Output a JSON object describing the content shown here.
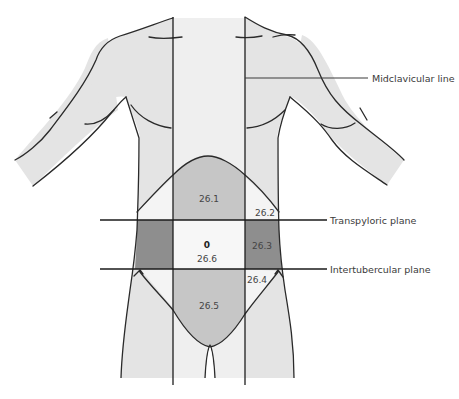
{
  "figure": {
    "colors": {
      "skin": "#e4e4e4",
      "midline_band": "#efefef",
      "region_medium": "#c6c6c6",
      "region_dark": "#8e8e8e",
      "region_light": "#f4f4f4",
      "outline": "#2a2a2a"
    }
  },
  "annotations": {
    "midclavicular": "Midclavicular line",
    "transpyloric": "Transpyloric plane",
    "intertubercular": "Intertubercular plane"
  },
  "regions": {
    "epigastric": "26.1",
    "right_hypochondriac": "26.2",
    "left_lumbar": "26.3",
    "left_iliac": "26.4",
    "hypogastric": "26.5",
    "umbilical_marker": "0",
    "umbilical": "26.6"
  }
}
